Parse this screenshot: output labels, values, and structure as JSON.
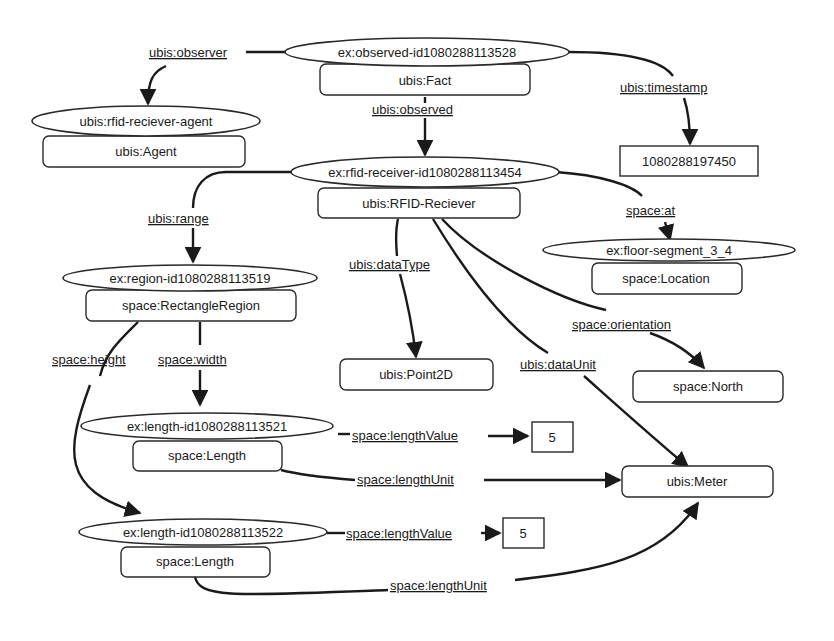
{
  "diagram": {
    "nodes": {
      "observed": {
        "id": "ex:observed-id1080288113528",
        "type": "ubis:Fact"
      },
      "agent": {
        "id": "ubis:rfid-reciever-agent",
        "type": "ubis:Agent"
      },
      "timestamp_value": "1080288197450",
      "receiver": {
        "id": "ex:rfid-receiver-id1080288113454",
        "type": "ubis:RFID-Reciever"
      },
      "floor": {
        "id": "ex:floor-segment_3_4",
        "type": "space:Location"
      },
      "region": {
        "id": "ex:region-id1080288113519",
        "type": "space:RectangleRegion"
      },
      "point2d": "ubis:Point2D",
      "north": "space:North",
      "length1": {
        "id": "ex:length-id1080288113521",
        "type": "space:Length"
      },
      "length2": {
        "id": "ex:length-id1080288113522",
        "type": "space:Length"
      },
      "value1": "5",
      "value2": "5",
      "meter": "ubis:Meter"
    },
    "edges": {
      "observer": "ubis:observer",
      "observed": "ubis:observed",
      "timestamp": "ubis:timestamp",
      "range": "ubis:range",
      "at": "space:at",
      "dataType": "ubis:dataType",
      "dataUnit": "ubis:dataUnit",
      "orientation": "space:orientation",
      "height": "space:height",
      "width": "space:width",
      "lengthValue1": "space:lengthValue",
      "lengthUnit1": "space:lengthUnit",
      "lengthValue2": "space:lengthValue",
      "lengthUnit2": "space:lengthUnit"
    }
  }
}
